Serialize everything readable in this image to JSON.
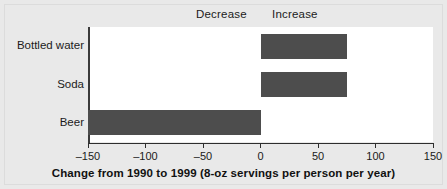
{
  "chart_data": {
    "type": "bar",
    "orientation": "horizontal",
    "title": "",
    "xlabel": "Change from 1990 to 1999 (8-oz servings per person per year)",
    "ylabel": "",
    "categories": [
      "Bottled water",
      "Soda",
      "Beer"
    ],
    "values": [
      75,
      75,
      -150
    ],
    "xlim": [
      -150,
      150
    ],
    "xticks": [
      -150,
      -100,
      -50,
      0,
      50,
      100,
      150
    ],
    "xticklabels": [
      "–150",
      "–100",
      "–50",
      "0",
      "50",
      "100",
      "150"
    ],
    "grid": false,
    "legend": false,
    "annotations": [
      {
        "text": "Decrease",
        "side": "left"
      },
      {
        "text": "Increase",
        "side": "right"
      }
    ],
    "bar_color": "#4d4d4d",
    "plot_background": "#ffffff",
    "figure_background": "#e9e9e9"
  },
  "zones": {
    "decrease": "Decrease",
    "increase": "Increase"
  },
  "axis": {
    "title": "Change from 1990 to 1999 (8-oz servings per person per year)",
    "ticks": [
      {
        "value": -150,
        "label": "–150"
      },
      {
        "value": -100,
        "label": "–100"
      },
      {
        "value": -50,
        "label": "–50"
      },
      {
        "value": 0,
        "label": "0"
      },
      {
        "value": 50,
        "label": "50"
      },
      {
        "value": 100,
        "label": "100"
      },
      {
        "value": 150,
        "label": "150"
      }
    ]
  },
  "categories": [
    {
      "label": "Bottled water",
      "value": 75
    },
    {
      "label": "Soda",
      "value": 75
    },
    {
      "label": "Beer",
      "value": -150
    }
  ]
}
